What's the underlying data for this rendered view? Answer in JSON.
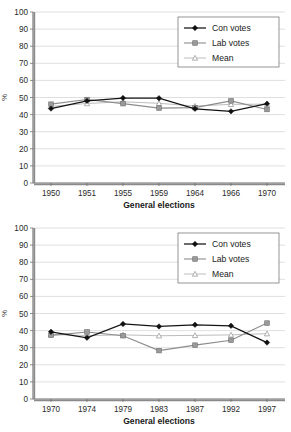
{
  "charts": [
    {
      "id": "chart-top",
      "chart_data": {
        "type": "line",
        "title": "",
        "xlabel": "General elections",
        "ylabel": "%",
        "ylim": [
          0,
          100
        ],
        "ytick_step": 10,
        "yticks": [
          "0",
          "10",
          "20",
          "30",
          "40",
          "50",
          "60",
          "70",
          "80",
          "90",
          "100"
        ],
        "grid": true,
        "legend_position": "top-right",
        "categories": [
          "1950",
          "1951",
          "1955",
          "1959",
          "1964",
          "1966",
          "1970"
        ],
        "series": [
          {
            "name": "Con votes",
            "marker": "diamond",
            "values": [
              43.5,
              48.0,
              49.7,
              49.6,
              43.4,
              41.9,
              46.4
            ]
          },
          {
            "name": "Lab votes",
            "marker": "square",
            "values": [
              46.1,
              48.8,
              46.4,
              43.8,
              44.1,
              48.0,
              43.0
            ]
          },
          {
            "name": "Mean",
            "marker": "triangle",
            "values": [
              44.8,
              46.5,
              47.5,
              46.6,
              45.0,
              46.0,
              46.1
            ]
          }
        ]
      }
    },
    {
      "id": "chart-bottom",
      "chart_data": {
        "type": "line",
        "title": "",
        "xlabel": "General elections",
        "ylabel": "%",
        "ylim": [
          0,
          100
        ],
        "ytick_step": 10,
        "yticks": [
          "0",
          "10",
          "20",
          "30",
          "40",
          "50",
          "60",
          "70",
          "80",
          "90",
          "100"
        ],
        "grid": true,
        "legend_position": "top-right",
        "categories": [
          "1970",
          "1974",
          "1979",
          "1983",
          "1987",
          "1992",
          "1997"
        ],
        "series": [
          {
            "name": "Con votes",
            "marker": "diamond",
            "values": [
              39.3,
              35.8,
              43.9,
              42.4,
              43.4,
              42.8,
              33.0
            ]
          },
          {
            "name": "Lab votes",
            "marker": "square",
            "values": [
              37.2,
              39.2,
              37.0,
              28.3,
              31.5,
              34.4,
              44.4
            ]
          },
          {
            "name": "Mean",
            "marker": "triangle",
            "values": [
              37.7,
              37.1,
              37.5,
              37.0,
              37.2,
              37.5,
              38.2
            ]
          }
        ]
      }
    }
  ],
  "legend": {
    "items": [
      {
        "label": "Con votes",
        "marker": "diamond",
        "color": "#141414"
      },
      {
        "label": "Lab votes",
        "marker": "square",
        "color": "#9a9a9a"
      },
      {
        "label": "Mean",
        "marker": "triangle",
        "color": "#b5b5b5"
      }
    ]
  },
  "colors": {
    "con": "#141414",
    "lab": "#9a9a9a",
    "mean": "#b5b5b5",
    "grid": "#c9c9c9",
    "axis": "#6e6e6e",
    "background": "#ffffff"
  }
}
